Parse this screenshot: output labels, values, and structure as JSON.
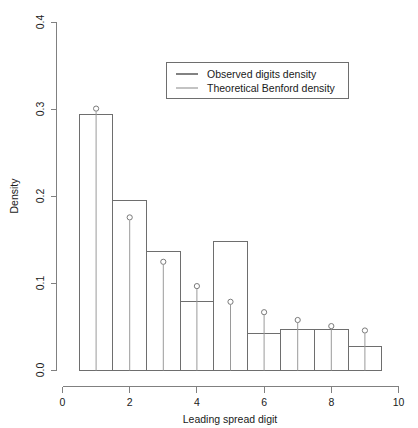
{
  "chart_data": {
    "type": "bar",
    "title": "",
    "subtitle": "",
    "xlabel": "Leading spread digit",
    "ylabel": "Density",
    "xlim": [
      0,
      10
    ],
    "ylim": [
      0.0,
      0.4
    ],
    "grid": false,
    "legend_position": "top-right",
    "x_ticks": [
      "0",
      "2",
      "4",
      "6",
      "8",
      "10"
    ],
    "x_tick_values": [
      0,
      2,
      4,
      6,
      8,
      10
    ],
    "y_ticks": [
      "0.0",
      "0.1",
      "0.2",
      "0.3",
      "0.4"
    ],
    "y_tick_values": [
      0.0,
      0.1,
      0.2,
      0.3,
      0.4
    ],
    "categories": [
      "1",
      "2",
      "3",
      "4",
      "5",
      "6",
      "7",
      "8",
      "9"
    ],
    "x": [
      1,
      2,
      3,
      4,
      5,
      6,
      7,
      8,
      9
    ],
    "bin_edges": [
      0.5,
      1.5,
      2.5,
      3.5,
      4.5,
      5.5,
      6.5,
      7.5,
      8.5,
      9.5
    ],
    "series": [
      {
        "name": "Observed digits density",
        "render": "histogram-bars",
        "color": "#6e6e6e",
        "values": [
          0.294,
          0.195,
          0.137,
          0.079,
          0.148,
          0.043,
          0.047,
          0.047,
          0.028
        ]
      },
      {
        "name": "Theoretical Benford density",
        "render": "stem-with-open-circles",
        "color": "#9a9a9a",
        "values": [
          0.301,
          0.176,
          0.125,
          0.097,
          0.079,
          0.067,
          0.058,
          0.051,
          0.046
        ]
      }
    ]
  },
  "legend": {
    "items": [
      {
        "label": "Observed digits density",
        "style": "line",
        "color": "#4d4d4d"
      },
      {
        "label": "Theoretical Benford density",
        "style": "line",
        "color": "#9a9a9a"
      }
    ]
  },
  "axes": {
    "y_title": "Density",
    "x_title": "Leading spread digit"
  }
}
